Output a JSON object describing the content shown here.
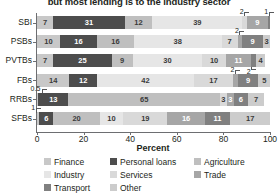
{
  "chart_data": {
    "type": "bar",
    "orientation": "horizontal",
    "stacked": true,
    "title": "but most lending is to the industry sector",
    "xlabel": "Percent",
    "ylabel": "",
    "xlim": [
      0,
      100
    ],
    "xticks": [
      0,
      20,
      40,
      60,
      80,
      100
    ],
    "grid": false,
    "legend_position": "bottom",
    "categories": [
      "SBI",
      "PSBs",
      "PVTBs",
      "FBs",
      "RRBs",
      "SFBs"
    ],
    "series": [
      {
        "name": "Finance",
        "color": "#c8c8c8",
        "values": [
          7,
          10,
          7,
          14,
          0.5,
          1
        ]
      },
      {
        "name": "Personal loans",
        "color": "#4d4d4d",
        "values": [
          31,
          16,
          25,
          12,
          13,
          6
        ]
      },
      {
        "name": "Agriculture",
        "color": "#bfbfbf",
        "values": [
          12,
          16,
          9,
          0,
          65,
          20
        ]
      },
      {
        "name": "Industry",
        "color": "#e6e6e6",
        "values": [
          39,
          38,
          30,
          42,
          0,
          10
        ]
      },
      {
        "name": "Services",
        "color": "#d9d9d9",
        "values": [
          2,
          7,
          10,
          17,
          3,
          19
        ]
      },
      {
        "name": "Trade",
        "color": "#a6a6a6",
        "values": [
          9,
          2,
          11,
          2,
          3,
          16
        ]
      },
      {
        "name": "Transport",
        "color": "#808080",
        "values": [
          1,
          9,
          2,
          9,
          6,
          11
        ]
      },
      {
        "name": "Other",
        "color": "#cccccc",
        "values": [
          0,
          3,
          4,
          5,
          7,
          17
        ]
      }
    ],
    "bars": [
      {
        "category": "SBI",
        "segments": [
          {
            "series": "Finance",
            "value": 7,
            "label": "7",
            "shown": "inside"
          },
          {
            "series": "Personal loans",
            "value": 31,
            "label": "31",
            "shown": "inside"
          },
          {
            "series": "Agriculture",
            "value": 12,
            "label": "12",
            "shown": "inside"
          },
          {
            "series": "Industry",
            "value": 39,
            "label": "39",
            "shown": "inside"
          },
          {
            "series": "Services",
            "value": 2,
            "label": "2",
            "shown": "callout-up"
          },
          {
            "series": "Trade",
            "value": 9,
            "label": "9",
            "shown": "inside"
          },
          {
            "series": "Transport",
            "value": 1,
            "label": "1",
            "shown": "callout-up"
          }
        ]
      },
      {
        "category": "PSBs",
        "segments": [
          {
            "series": "Finance",
            "value": 10,
            "label": "10",
            "shown": "inside"
          },
          {
            "series": "Personal loans",
            "value": 16,
            "label": "16",
            "shown": "inside"
          },
          {
            "series": "Agriculture",
            "value": 16,
            "label": "16",
            "shown": "inside"
          },
          {
            "series": "Industry",
            "value": 38,
            "label": "38",
            "shown": "inside"
          },
          {
            "series": "Services",
            "value": 7,
            "label": "7",
            "shown": "inside"
          },
          {
            "series": "Trade",
            "value": 2,
            "label": "2",
            "shown": "callout-up"
          },
          {
            "series": "Transport",
            "value": 9,
            "label": "9",
            "shown": "inside"
          },
          {
            "series": "Other",
            "value": 3,
            "label": "3",
            "shown": "inside"
          }
        ]
      },
      {
        "category": "PVTBs",
        "segments": [
          {
            "series": "Finance",
            "value": 7,
            "label": "7",
            "shown": "inside"
          },
          {
            "series": "Personal loans",
            "value": 25,
            "label": "25",
            "shown": "inside"
          },
          {
            "series": "Agriculture",
            "value": 9,
            "label": "9",
            "shown": "inside"
          },
          {
            "series": "Industry",
            "value": 30,
            "label": "30",
            "shown": "inside"
          },
          {
            "series": "Services",
            "value": 10,
            "label": "10",
            "shown": "inside"
          },
          {
            "series": "Trade",
            "value": 11,
            "label": "11",
            "shown": "inside"
          },
          {
            "series": "Transport",
            "value": 2,
            "label": "2",
            "shown": "callout-down"
          },
          {
            "series": "Other",
            "value": 4,
            "label": "4",
            "shown": "inside"
          }
        ]
      },
      {
        "category": "FBs",
        "segments": [
          {
            "series": "Finance",
            "value": 14,
            "label": "14",
            "shown": "inside"
          },
          {
            "series": "Personal loans",
            "value": 12,
            "label": "12",
            "shown": "inside"
          },
          {
            "series": "Industry",
            "value": 42,
            "label": "42",
            "shown": "inside"
          },
          {
            "series": "Services",
            "value": 17,
            "label": "17",
            "shown": "inside"
          },
          {
            "series": "Trade",
            "value": 2,
            "label": "2",
            "shown": "callout-up"
          },
          {
            "series": "Transport",
            "value": 9,
            "label": "9",
            "shown": "inside"
          },
          {
            "series": "Other",
            "value": 5,
            "label": "5",
            "shown": "inside"
          }
        ]
      },
      {
        "category": "RRBs",
        "segments": [
          {
            "series": "Finance",
            "value": 0.5,
            "label": "0.5",
            "shown": "callout-up"
          },
          {
            "series": "Personal loans",
            "value": 13,
            "label": "13",
            "shown": "inside"
          },
          {
            "series": "Agriculture",
            "value": 65,
            "label": "65",
            "shown": "inside"
          },
          {
            "series": "Services",
            "value": 3,
            "label": "3",
            "shown": "inside"
          },
          {
            "series": "Trade",
            "value": 3,
            "label": "3",
            "shown": "inside"
          },
          {
            "series": "Transport",
            "value": 6,
            "label": "6",
            "shown": "inside"
          },
          {
            "series": "Other",
            "value": 7,
            "label": "7",
            "shown": "inside"
          }
        ]
      },
      {
        "category": "SFBs",
        "segments": [
          {
            "series": "Finance",
            "value": 1,
            "label": "1",
            "shown": "callout-up"
          },
          {
            "series": "Personal loans",
            "value": 6,
            "label": "6",
            "shown": "inside"
          },
          {
            "series": "Agriculture",
            "value": 20,
            "label": "20",
            "shown": "inside"
          },
          {
            "series": "Industry",
            "value": 10,
            "label": "10",
            "shown": "inside"
          },
          {
            "series": "Services",
            "value": 19,
            "label": "19",
            "shown": "inside"
          },
          {
            "series": "Trade",
            "value": 16,
            "label": "16",
            "shown": "inside"
          },
          {
            "series": "Transport",
            "value": 11,
            "label": "11",
            "shown": "inside"
          },
          {
            "series": "Other",
            "value": 17,
            "label": "17",
            "shown": "inside"
          }
        ]
      }
    ]
  },
  "legend": {
    "items": [
      {
        "label": "Finance",
        "color": "#c8c8c8"
      },
      {
        "label": "Personal loans",
        "color": "#4d4d4d"
      },
      {
        "label": "Agriculture",
        "color": "#bfbfbf"
      },
      {
        "label": "Industry",
        "color": "#e6e6e6"
      },
      {
        "label": "Services",
        "color": "#d9d9d9"
      },
      {
        "label": "Trade",
        "color": "#a6a6a6"
      },
      {
        "label": "Transport",
        "color": "#808080"
      },
      {
        "label": "Other",
        "color": "#cccccc"
      }
    ]
  }
}
